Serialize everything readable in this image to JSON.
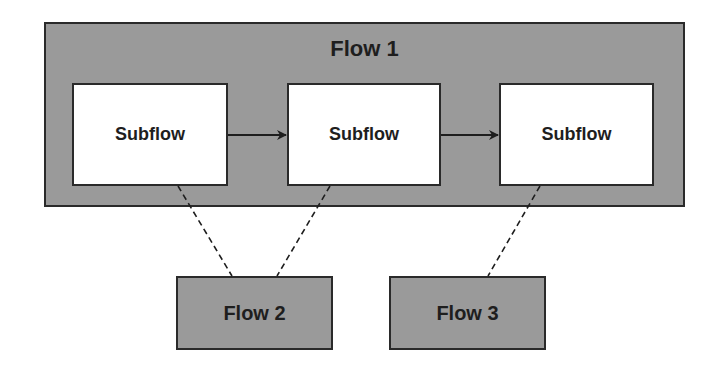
{
  "diagram": {
    "container": {
      "label": "Flow 1",
      "fill": "#9a9a9a"
    },
    "subflows": [
      {
        "label": "Subflow"
      },
      {
        "label": "Subflow"
      },
      {
        "label": "Subflow"
      }
    ],
    "external_flows": [
      {
        "label": "Flow 2",
        "fill": "#9a9a9a"
      },
      {
        "label": "Flow 3",
        "fill": "#9a9a9a"
      }
    ],
    "connections": [
      {
        "from": "Subflow 1",
        "to": "Subflow 2",
        "style": "solid-arrow"
      },
      {
        "from": "Subflow 2",
        "to": "Subflow 3",
        "style": "solid-arrow"
      },
      {
        "from": "Subflow 1",
        "to": "Flow 2",
        "style": "dashed"
      },
      {
        "from": "Subflow 2",
        "to": "Flow 2",
        "style": "dashed"
      },
      {
        "from": "Subflow 3",
        "to": "Flow 3",
        "style": "dashed"
      }
    ]
  }
}
